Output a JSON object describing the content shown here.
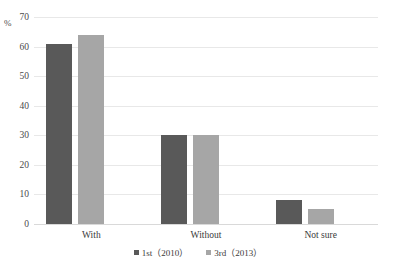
{
  "chart_data": {
    "type": "bar",
    "title": "",
    "xlabel": "",
    "ylabel": "%",
    "ylim": [
      0,
      70
    ],
    "yticks": [
      0,
      10,
      20,
      30,
      40,
      50,
      60,
      70
    ],
    "grid": true,
    "legend_position": "bottom",
    "categories": [
      "With",
      "Without",
      "Not sure"
    ],
    "series": [
      {
        "name": "1st（2010）",
        "color": "#595959",
        "values": [
          61,
          30,
          8
        ]
      },
      {
        "name": "3rd（2013）",
        "color": "#a6a6a6",
        "values": [
          64,
          30,
          5
        ]
      }
    ]
  },
  "axis": {
    "unit_label": "%",
    "tick_labels": [
      "0",
      "10",
      "20",
      "30",
      "40",
      "50",
      "60",
      "70"
    ]
  },
  "legend": {
    "items": [
      {
        "label": "1st（2010）",
        "swatch": "legend-swatch-series-1"
      },
      {
        "label": "3rd（2013）",
        "swatch": "legend-swatch-series-2"
      }
    ]
  },
  "colors": {
    "series_1": "#595959",
    "series_2": "#a6a6a6",
    "gridline": "#e8e8e8",
    "background": "#ffffff"
  }
}
